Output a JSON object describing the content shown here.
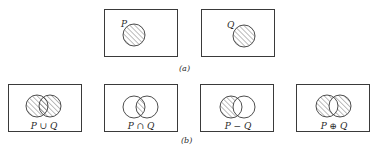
{
  "diagram": {
    "colors": {
      "stroke": "#3a3a3a",
      "hatch": "#6a6a6a",
      "background": "#ffffff"
    },
    "part_a": {
      "caption": "(a)",
      "panels": [
        {
          "set_label": "P",
          "shaded": "P"
        },
        {
          "set_label": "Q",
          "shaded": "Q"
        }
      ]
    },
    "part_b": {
      "caption": "(b)",
      "panels": [
        {
          "label": "P ∪ Q",
          "operation": "union",
          "shaded": "P or Q"
        },
        {
          "label": "P ∩ Q",
          "operation": "intersection",
          "shaded": "P and Q"
        },
        {
          "label": "P − Q",
          "operation": "difference",
          "shaded": "P only"
        },
        {
          "label": "P ⊕ Q",
          "operation": "symmetric difference",
          "shaded": "P only and Q only"
        }
      ]
    }
  }
}
